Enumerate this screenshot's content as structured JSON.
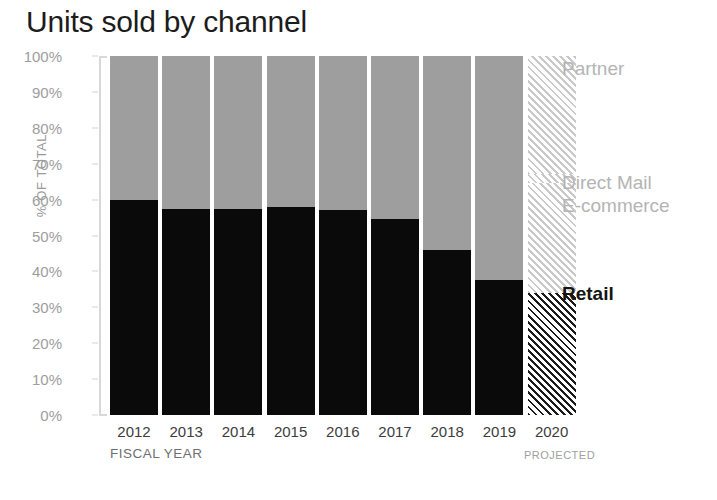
{
  "chart_data": {
    "type": "bar",
    "subtype": "stacked-percentage-column",
    "title": "Units sold by channel",
    "xlabel": "FISCAL YEAR",
    "ylabel": "% OF TOTAL",
    "ylim": [
      0,
      100
    ],
    "ytick_labels": [
      "100%",
      "90%",
      "80%",
      "70%",
      "60%",
      "50%",
      "40%",
      "30%",
      "20%",
      "10%",
      "0%"
    ],
    "ytick_values": [
      100,
      90,
      80,
      70,
      60,
      50,
      40,
      30,
      20,
      10,
      0
    ],
    "categories": [
      "2012",
      "2013",
      "2014",
      "2015",
      "2016",
      "2017",
      "2018",
      "2019",
      "2020"
    ],
    "grid": false,
    "legend_position": "right",
    "annotations": [
      "PROJECTED"
    ],
    "projected_categories": [
      "2020"
    ],
    "series": [
      {
        "name": "Retail",
        "color": "#0a0a0a",
        "emphasis": true,
        "values": [
          60,
          57.5,
          57.5,
          58,
          57,
          54.5,
          46,
          37.5,
          34
        ]
      },
      {
        "name": "E-commerce",
        "color": "#9e9e9e",
        "emphasis": false,
        "values": [
          20.8,
          22.5,
          22.5,
          22,
          25.5,
          28,
          30.5,
          30,
          30.5
        ]
      },
      {
        "name": "Direct Mail",
        "color": "#9e9e9e",
        "emphasis": false,
        "values": [
          2.7,
          2.7,
          2.7,
          2.7,
          2.5,
          2.5,
          2.5,
          2.8,
          2.5
        ]
      },
      {
        "name": "Partner",
        "color": "#9e9e9e",
        "emphasis": false,
        "values": [
          16.5,
          17.3,
          17.3,
          17.3,
          15,
          15,
          21,
          29.7,
          33
        ]
      }
    ]
  },
  "legend": {
    "items": [
      {
        "label": "Partner",
        "y": 57,
        "strong": false
      },
      {
        "label": "Direct Mail",
        "y": 171,
        "strong": false
      },
      {
        "label": "E-commerce",
        "y": 194,
        "strong": false
      },
      {
        "label": "Retail",
        "y": 282,
        "strong": true
      }
    ]
  },
  "axis": {
    "x_title": "FISCAL YEAR",
    "projected_note": "PROJECTED"
  }
}
